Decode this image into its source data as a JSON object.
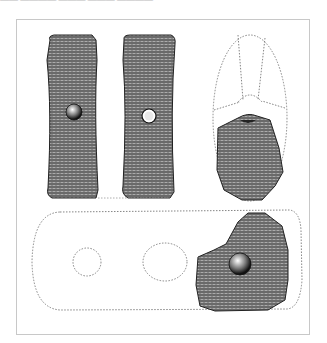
{
  "header": {
    "clipped_caption": "—— ———— ——— ——— ————"
  },
  "figure": {
    "views": [
      {
        "id": "face-a",
        "label": "front face with hole"
      },
      {
        "id": "face-b",
        "label": "back face with hole"
      },
      {
        "id": "side-reconstruction",
        "label": "fragment with dotted oval reconstruction"
      },
      {
        "id": "plan-reconstruction",
        "label": "fragment with dotted elongated outline and two dotted holes"
      }
    ],
    "colors": {
      "ink": "#2a2a2a",
      "stone": "#6d6d6d",
      "frame": "#c8c8c8",
      "dotted": "#777777"
    }
  }
}
